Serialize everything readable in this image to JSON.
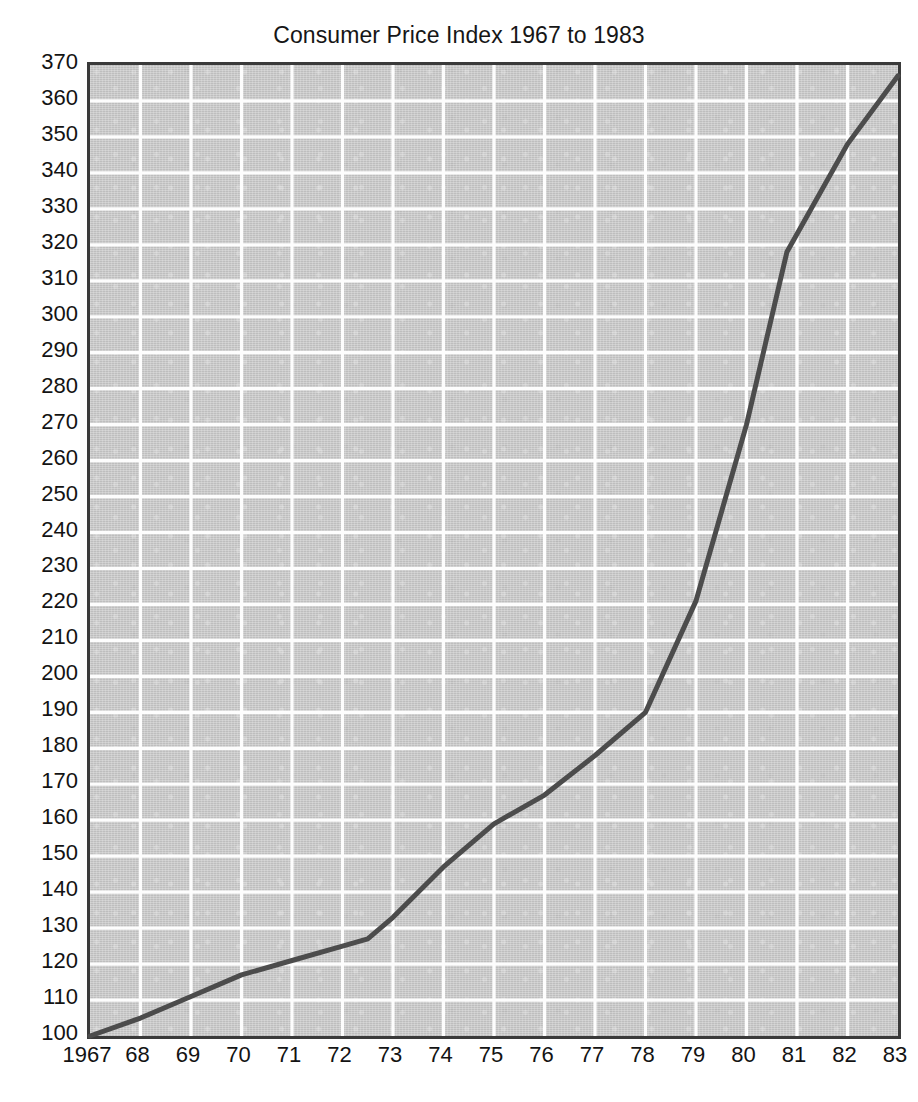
{
  "chart_data": {
    "type": "line",
    "title": "Consumer Price Index 1967 to 1983",
    "xlabel": "",
    "ylabel": "",
    "xlim": [
      1967,
      1983
    ],
    "ylim": [
      100,
      370
    ],
    "grid": true,
    "legend": "none",
    "x_tick_labels": [
      "1967",
      "68",
      "69",
      "70",
      "71",
      "72",
      "73",
      "74",
      "75",
      "76",
      "77",
      "78",
      "79",
      "80",
      "81",
      "82",
      "83"
    ],
    "x": [
      1967,
      1968,
      1969,
      1970,
      1971,
      1972,
      1972.5,
      1973,
      1974,
      1975,
      1976,
      1977,
      1978,
      1979,
      1980,
      1980.8,
      1982,
      1983
    ],
    "y_tick_labels": [
      "370",
      "360",
      "350",
      "340",
      "330",
      "320",
      "310",
      "300",
      "290",
      "280",
      "270",
      "260",
      "250",
      "240",
      "230",
      "220",
      "210",
      "200",
      "190",
      "180",
      "170",
      "160",
      "150",
      "140",
      "130",
      "120",
      "110",
      "100"
    ],
    "series": [
      {
        "name": "Consumer Price Index",
        "color": "#4c4c4c",
        "values": [
          100,
          105,
          111,
          117,
          121,
          125,
          127,
          133,
          147,
          159,
          167,
          178,
          190,
          221,
          270,
          318,
          348,
          367
        ]
      }
    ],
    "annotations": []
  },
  "style": {
    "plot_background": "#c8c8c8",
    "gridline_color": "#fdfdfd",
    "axis_border_color": "#3a3a3a",
    "page_background": "#ffffff",
    "text_color": "#131313"
  }
}
